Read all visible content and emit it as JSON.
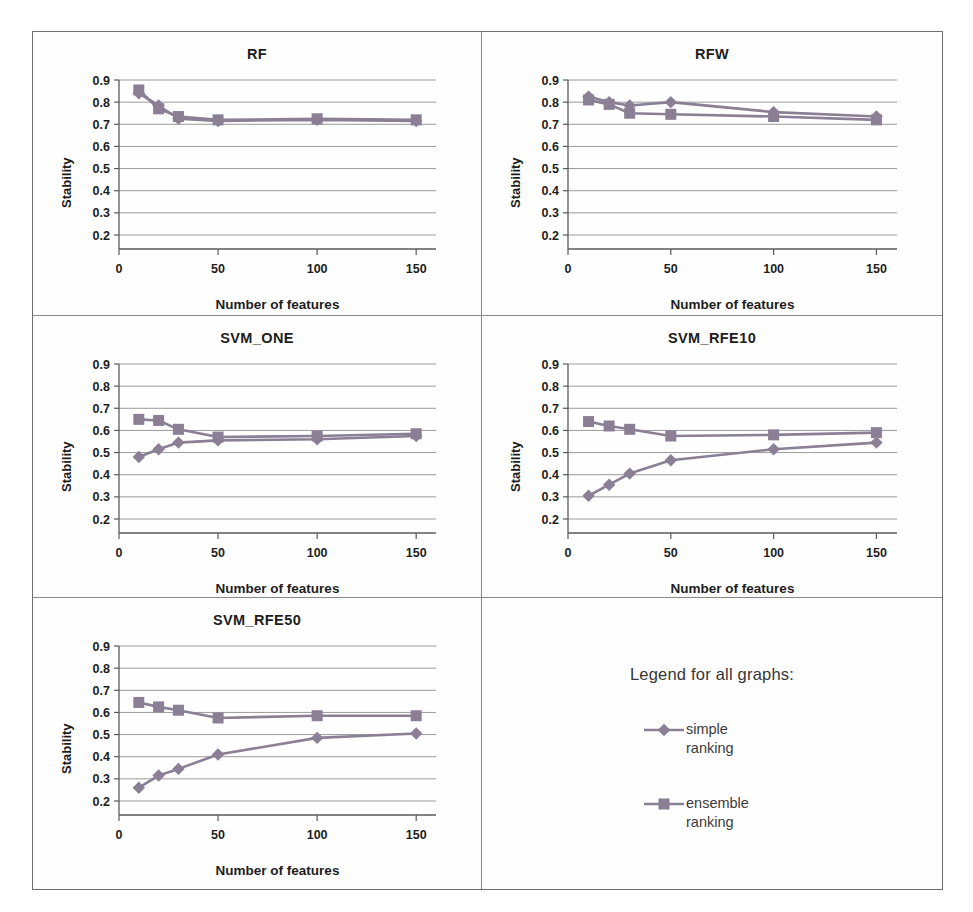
{
  "figure": {
    "axis_labels": {
      "x": "Number of features",
      "y": "Stability"
    },
    "legend_panel": {
      "title": "Legend for all graphs:",
      "items": [
        {
          "label_line1": "simple",
          "label_line2": "ranking",
          "marker": "diamond-marker",
          "color": "#8a7f95"
        },
        {
          "label_line1": "ensemble",
          "label_line2": "ranking",
          "marker": "square-marker",
          "color": "#8a7f95"
        }
      ]
    },
    "colors": {
      "simple_series": "#8a7f95",
      "ensemble_series": "#8a7f95",
      "gridline": "#9a9a9a",
      "axis": "#5a5a5a",
      "panel_border": "#8a8a8a",
      "figure_border": "#6e6e6e"
    }
  },
  "chart_data": [
    {
      "type": "line",
      "title": "RF",
      "xlabel": "Number of features",
      "ylabel": "Stability",
      "x": [
        10,
        20,
        30,
        50,
        100,
        150
      ],
      "xlim": [
        0,
        160
      ],
      "ylim": [
        0.2,
        0.9
      ],
      "xticks": [
        0,
        50,
        100,
        150
      ],
      "yticks": [
        0.2,
        0.3,
        0.4,
        0.5,
        0.6,
        0.7,
        0.8,
        0.9
      ],
      "grid": true,
      "legend_position": "external",
      "series": [
        {
          "name": "simple ranking",
          "marker": "diamond",
          "values": [
            0.84,
            0.785,
            0.725,
            0.715,
            0.72,
            0.715
          ]
        },
        {
          "name": "ensemble ranking",
          "marker": "square",
          "values": [
            0.855,
            0.77,
            0.735,
            0.72,
            0.725,
            0.72
          ]
        }
      ]
    },
    {
      "type": "line",
      "title": "RFW",
      "xlabel": "Number of features",
      "ylabel": "Stability",
      "x": [
        10,
        20,
        30,
        50,
        100,
        150
      ],
      "xlim": [
        0,
        160
      ],
      "ylim": [
        0.2,
        0.9
      ],
      "xticks": [
        0,
        50,
        100,
        150
      ],
      "yticks": [
        0.2,
        0.3,
        0.4,
        0.5,
        0.6,
        0.7,
        0.8,
        0.9
      ],
      "grid": true,
      "legend_position": "external",
      "series": [
        {
          "name": "simple ranking",
          "marker": "diamond",
          "values": [
            0.825,
            0.8,
            0.785,
            0.8,
            0.755,
            0.735
          ]
        },
        {
          "name": "ensemble ranking",
          "marker": "square",
          "values": [
            0.81,
            0.79,
            0.75,
            0.745,
            0.735,
            0.72
          ]
        }
      ]
    },
    {
      "type": "line",
      "title": "SVM_ONE",
      "xlabel": "Number of features",
      "ylabel": "Stability",
      "x": [
        10,
        20,
        30,
        50,
        100,
        150
      ],
      "xlim": [
        0,
        160
      ],
      "ylim": [
        0.2,
        0.9
      ],
      "xticks": [
        0,
        50,
        100,
        150
      ],
      "yticks": [
        0.2,
        0.3,
        0.4,
        0.5,
        0.6,
        0.7,
        0.8,
        0.9
      ],
      "grid": true,
      "legend_position": "external",
      "series": [
        {
          "name": "simple ranking",
          "marker": "diamond",
          "values": [
            0.48,
            0.515,
            0.545,
            0.555,
            0.56,
            0.575
          ]
        },
        {
          "name": "ensemble ranking",
          "marker": "square",
          "values": [
            0.65,
            0.645,
            0.605,
            0.57,
            0.575,
            0.585
          ]
        }
      ]
    },
    {
      "type": "line",
      "title": "SVM_RFE10",
      "xlabel": "Number of features",
      "ylabel": "Stability",
      "x": [
        10,
        20,
        30,
        50,
        100,
        150
      ],
      "xlim": [
        0,
        160
      ],
      "ylim": [
        0.2,
        0.9
      ],
      "xticks": [
        0,
        50,
        100,
        150
      ],
      "yticks": [
        0.2,
        0.3,
        0.4,
        0.5,
        0.6,
        0.7,
        0.8,
        0.9
      ],
      "grid": true,
      "legend_position": "external",
      "series": [
        {
          "name": "simple ranking",
          "marker": "diamond",
          "values": [
            0.305,
            0.355,
            0.405,
            0.465,
            0.515,
            0.545
          ]
        },
        {
          "name": "ensemble ranking",
          "marker": "square",
          "values": [
            0.64,
            0.62,
            0.605,
            0.575,
            0.58,
            0.59
          ]
        }
      ]
    },
    {
      "type": "line",
      "title": "SVM_RFE50",
      "xlabel": "Number of features",
      "ylabel": "Stability",
      "x": [
        10,
        20,
        30,
        50,
        100,
        150
      ],
      "xlim": [
        0,
        160
      ],
      "ylim": [
        0.2,
        0.9
      ],
      "xticks": [
        0,
        50,
        100,
        150
      ],
      "yticks": [
        0.2,
        0.3,
        0.4,
        0.5,
        0.6,
        0.7,
        0.8,
        0.9
      ],
      "grid": true,
      "legend_position": "external",
      "series": [
        {
          "name": "simple ranking",
          "marker": "diamond",
          "values": [
            0.26,
            0.315,
            0.345,
            0.41,
            0.485,
            0.505
          ]
        },
        {
          "name": "ensemble ranking",
          "marker": "square",
          "values": [
            0.645,
            0.625,
            0.61,
            0.575,
            0.585,
            0.585
          ]
        }
      ]
    }
  ]
}
